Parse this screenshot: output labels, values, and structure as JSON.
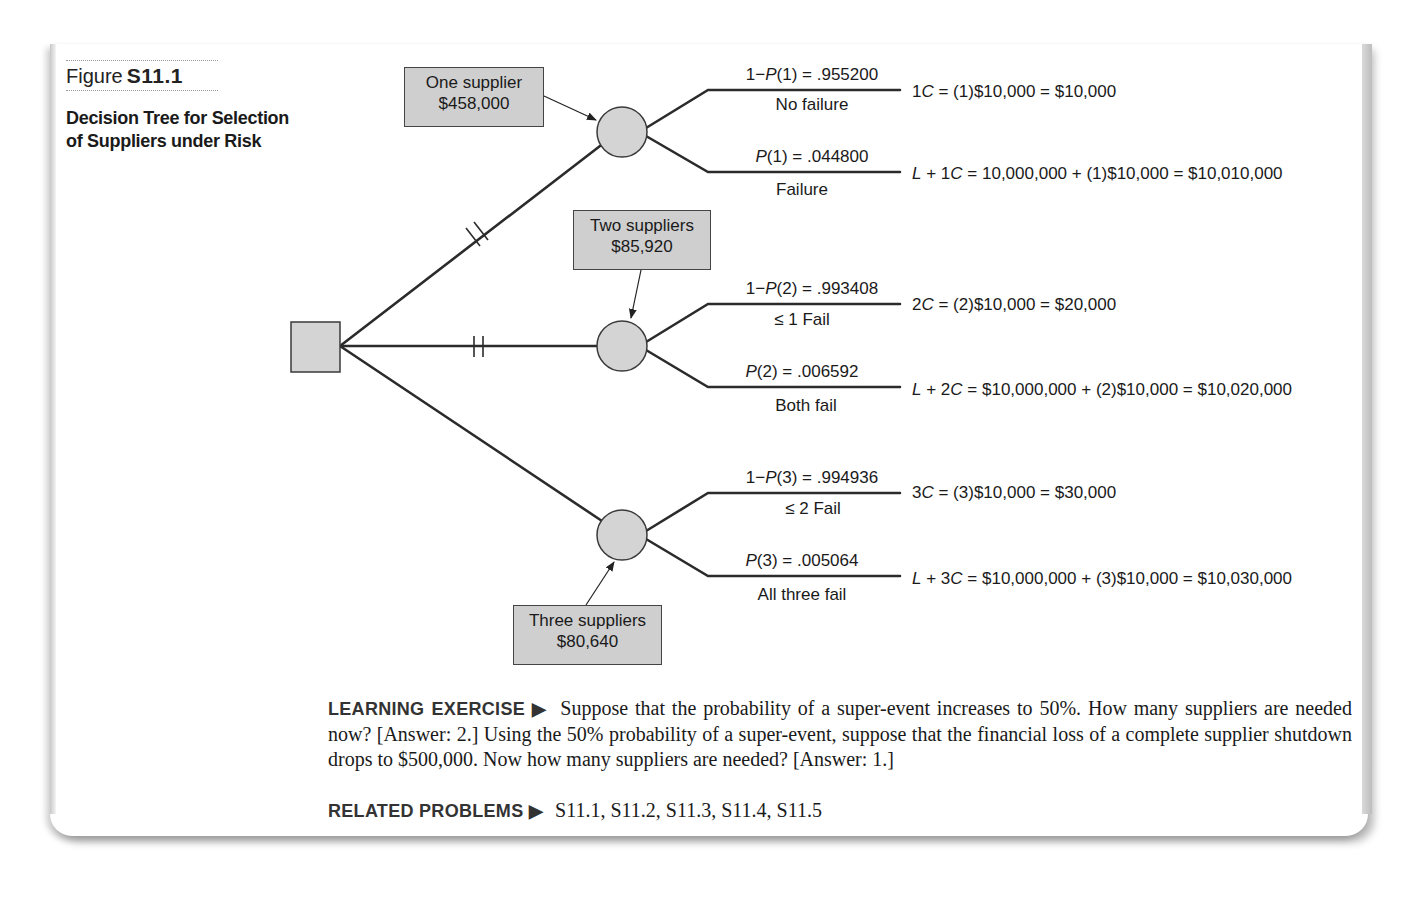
{
  "figure": {
    "label": "Figure",
    "number": "S11.1",
    "title_line1": "Decision Tree for Selection",
    "title_line2": "of Suppliers under Risk"
  },
  "tree": {
    "decision_node": "decision",
    "options": [
      {
        "name": "One supplier",
        "expected_cost": "$458,000",
        "pruned": true,
        "branches": [
          {
            "prob_prefix": "1−",
            "prob_var": "P",
            "prob_suffix": "(1) = .955200",
            "event": "No failure",
            "payoff_pre": "1",
            "payoff_var": "C",
            "payoff_rest": " = (1)$10,000 = $10,000"
          },
          {
            "prob_prefix": "",
            "prob_var": "P",
            "prob_suffix": "(1) = .044800",
            "event": "Failure",
            "payoff_pre": "",
            "payoff_var": "L",
            "payoff_mid": " + 1",
            "payoff_var2": "C",
            "payoff_rest": " = 10,000,000 + (1)$10,000 = $10,010,000"
          }
        ]
      },
      {
        "name": "Two suppliers",
        "expected_cost": "$85,920",
        "pruned": true,
        "branches": [
          {
            "prob_prefix": "1−",
            "prob_var": "P",
            "prob_suffix": "(2) = .993408",
            "event": "≤ 1 Fail",
            "payoff_pre": "2",
            "payoff_var": "C",
            "payoff_rest": " = (2)$10,000 = $20,000"
          },
          {
            "prob_prefix": "",
            "prob_var": "P",
            "prob_suffix": "(2) = .006592",
            "event": "Both fail",
            "payoff_pre": "",
            "payoff_var": "L",
            "payoff_mid": " + 2",
            "payoff_var2": "C",
            "payoff_rest": " = $10,000,000 + (2)$10,000 = $10,020,000"
          }
        ]
      },
      {
        "name": "Three suppliers",
        "expected_cost": "$80,640",
        "pruned": false,
        "branches": [
          {
            "prob_prefix": "1−",
            "prob_var": "P",
            "prob_suffix": "(3) = .994936",
            "event": "≤ 2 Fail",
            "payoff_pre": "3",
            "payoff_var": "C",
            "payoff_rest": " = (3)$10,000 = $30,000"
          },
          {
            "prob_prefix": "",
            "prob_var": "P",
            "prob_suffix": "(3) = .005064",
            "event": "All three fail",
            "payoff_pre": "",
            "payoff_var": "L",
            "payoff_mid": " + 3",
            "payoff_var2": "C",
            "payoff_rest": " = $10,000,000 + (3)$10,000 = $10,030,000"
          }
        ]
      }
    ]
  },
  "learning_exercise": {
    "heading": "LEARNING EXERCISE ▶",
    "text": "Suppose that the probability of a super-event increases to 50%. How many suppliers are needed now? [Answer: 2.] Using the 50% probability of a super-event, suppose that the financial loss of a complete supplier shutdown drops to $500,000. Now how many suppliers are needed? [Answer: 1.]"
  },
  "related_problems": {
    "heading": "RELATED PROBLEMS ▶",
    "text": "S11.1, S11.2, S11.3, S11.4, S11.5"
  },
  "colors": {
    "node_fill": "#d4d4d4",
    "box_fill": "#cfcfcf",
    "line": "#2b2b2b"
  }
}
